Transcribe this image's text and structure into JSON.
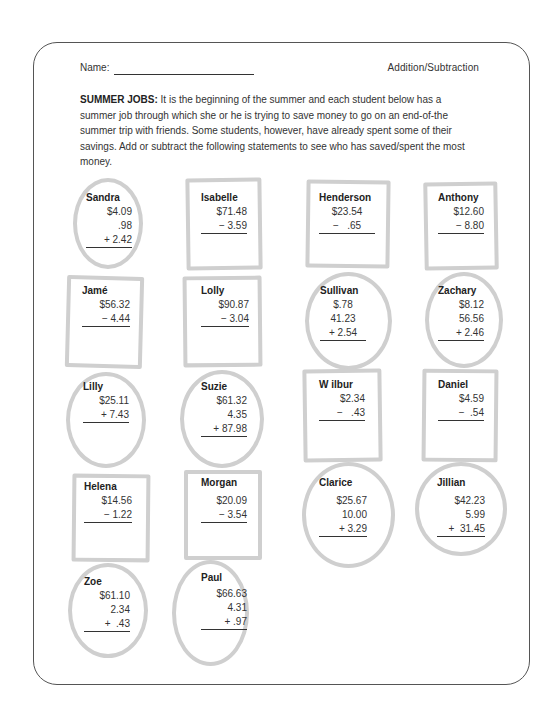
{
  "header": {
    "name_label": "Name:",
    "topic": "Addition/Subtraction"
  },
  "intro": {
    "title": "SUMMER JOBS:",
    "text": " It is the beginning of the summer and each student below has a summer job through which she or he is trying to save money to go on an end-of-the summer trip with friends. Some students, however, have already spent some of their savings.  Add or subtract the following statements to see who has saved/spent the most money."
  },
  "problems": [
    {
      "name": "Sandra",
      "shape": "oval",
      "lines": [
        "$4.09",
        ".98",
        "+ 2.42"
      ]
    },
    {
      "name": "Isabelle",
      "shape": "box",
      "lines": [
        "$71.48",
        "− 3.59"
      ]
    },
    {
      "name": "Henderson",
      "shape": "box",
      "lines": [
        "$23.54",
        "−   .65"
      ]
    },
    {
      "name": "Anthony",
      "shape": "box",
      "lines": [
        "$12.60",
        "− 8.80"
      ]
    },
    {
      "name": "Jamé",
      "shape": "box",
      "lines": [
        "$56.32",
        "− 4.44"
      ]
    },
    {
      "name": "Lolly",
      "shape": "box",
      "lines": [
        "$90.87",
        "− 3.04"
      ]
    },
    {
      "name": "Sullivan",
      "shape": "oval",
      "lines": [
        "$.78",
        "41.23",
        "+ 2.54"
      ]
    },
    {
      "name": "Zachary",
      "shape": "oval",
      "lines": [
        "$8.12",
        "56.56",
        "+ 2.46"
      ]
    },
    {
      "name": "Lilly",
      "shape": "oval",
      "lines": [
        "$25.11",
        "+ 7.43"
      ]
    },
    {
      "name": "Suzie",
      "shape": "oval",
      "lines": [
        "$61.32",
        "4.35",
        "+ 87.98"
      ]
    },
    {
      "name": "W ilbur",
      "shape": "box",
      "lines": [
        "$2.34",
        "−   .43"
      ]
    },
    {
      "name": "Daniel",
      "shape": "box",
      "lines": [
        "$4.59",
        "−  .54"
      ]
    },
    {
      "name": "Helena",
      "shape": "box",
      "lines": [
        "$14.56",
        "− 1.22"
      ]
    },
    {
      "name": "Morgan",
      "shape": "box",
      "lines": [
        "$20.09",
        "− 3.54"
      ]
    },
    {
      "name": "Clarice",
      "shape": "oval",
      "lines": [
        "$25.67",
        "10.00",
        "+ 3.29"
      ]
    },
    {
      "name": "Jillian",
      "shape": "oval",
      "lines": [
        "$42.23",
        "5.99",
        "+  31.45"
      ]
    },
    {
      "name": "Zoe",
      "shape": "oval",
      "lines": [
        "$61.10",
        "2.34",
        "+  .43"
      ]
    },
    {
      "name": "Paul",
      "shape": "oval",
      "lines": [
        "$66.63",
        "4.31",
        "+ .97"
      ]
    }
  ]
}
